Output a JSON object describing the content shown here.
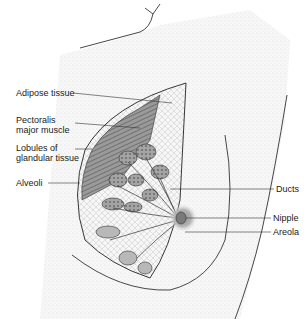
{
  "diagram": {
    "labels_left": [
      {
        "id": "adipose",
        "line1": "Adipose tissue",
        "line2": ""
      },
      {
        "id": "pectoralis",
        "line1": "Pectoralis",
        "line2": "major muscle"
      },
      {
        "id": "lobules",
        "line1": "Lobules of",
        "line2": "glandular tissue"
      },
      {
        "id": "alveoli",
        "line1": "Alveoli",
        "line2": ""
      }
    ],
    "labels_right": [
      {
        "id": "ducts",
        "text": "Ducts"
      },
      {
        "id": "nipple",
        "text": "Nipple"
      },
      {
        "id": "areola",
        "text": "Areola"
      }
    ],
    "colors": {
      "line": "#2a2a2a",
      "muscle": "#8a8a8a",
      "lobule": "#9a9a9a",
      "areola": "#a8a8a8",
      "skin_shade": "#e6e6e6"
    }
  }
}
